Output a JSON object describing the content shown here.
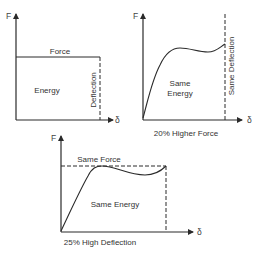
{
  "colors": {
    "line": "#2a2a2a",
    "text": "#333333",
    "background": "#ffffff"
  },
  "diagrams": [
    {
      "id": "baseline",
      "y_axis_label": "F",
      "x_axis_label": "δ",
      "labels": {
        "top": "Force",
        "area": "Energy",
        "side": "Deflection"
      },
      "caption": ""
    },
    {
      "id": "higher-force",
      "y_axis_label": "F",
      "x_axis_label": "δ",
      "labels": {
        "area_line1": "Same",
        "area_line2": "Energy",
        "side": "Same Deflection"
      },
      "caption": "20% Higher Force"
    },
    {
      "id": "higher-deflection",
      "y_axis_label": "F",
      "x_axis_label": "δ",
      "labels": {
        "top": "Same Force",
        "area": "Same Energy"
      },
      "caption": "25% High Deflection"
    }
  ]
}
